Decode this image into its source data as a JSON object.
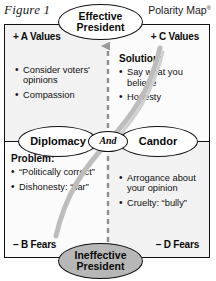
{
  "figure": {
    "label": "Figure 1",
    "title": "Polarity Map",
    "title_mark": "®"
  },
  "poles": {
    "left": "Diplomacy",
    "right": "Candor",
    "connector": "And",
    "upside_outcome_line1": "Effective",
    "upside_outcome_line2": "President",
    "downside_outcome_line1": "Ineffective",
    "downside_outcome_line2": "President"
  },
  "quadrants": {
    "upper_left": {
      "corner_label": "+ A Values",
      "header": "",
      "items": [
        "Consider voters' opinions",
        "Compassion"
      ]
    },
    "upper_right": {
      "corner_label": "+ C Values",
      "header": "Solution:",
      "items": [
        "Say what you believe",
        "Honesty"
      ]
    },
    "lower_left": {
      "corner_label": "– B Fears",
      "header": "Problem:",
      "items": [
        "“Politically correct”",
        "Dishonesty: “liar”"
      ]
    },
    "lower_right": {
      "corner_label": "– D Fears",
      "header": "",
      "items": [
        "Arrogance about your opinion",
        "Cruelty: “bully”"
      ]
    }
  },
  "colors": {
    "ink": "#111111",
    "quadrant_tint": "#f2f2f2",
    "downside_oval_fill": "#b7b7b7",
    "loop_gray": "#b9b9b9",
    "arrow_gray": "#9a9a9a"
  }
}
